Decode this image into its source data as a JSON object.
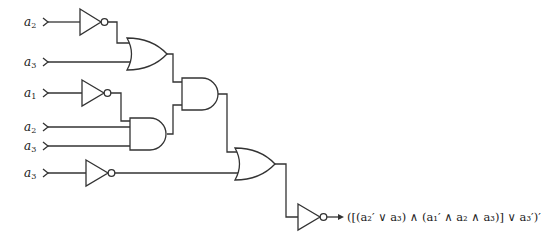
{
  "diagram": {
    "type": "logic-circuit",
    "inputs": [
      {
        "id": "in1",
        "var": "a",
        "sub": "2",
        "y": 22
      },
      {
        "id": "in2",
        "var": "a",
        "sub": "3",
        "y": 62
      },
      {
        "id": "in3",
        "var": "a",
        "sub": "1",
        "y": 93
      },
      {
        "id": "in4",
        "var": "a",
        "sub": "2",
        "y": 127
      },
      {
        "id": "in5",
        "var": "a",
        "sub": "3",
        "y": 146
      },
      {
        "id": "in6",
        "var": "a",
        "sub": "3",
        "y": 173
      }
    ],
    "gates": [
      {
        "id": "not1",
        "type": "NOT",
        "input": "a2"
      },
      {
        "id": "or1",
        "type": "OR",
        "inputs": [
          "not1",
          "a3"
        ]
      },
      {
        "id": "not2",
        "type": "NOT",
        "input": "a1"
      },
      {
        "id": "and2",
        "type": "AND",
        "inputs": [
          "not2",
          "a2",
          "a3"
        ]
      },
      {
        "id": "and1",
        "type": "AND",
        "inputs": [
          "or1",
          "and2"
        ]
      },
      {
        "id": "not3",
        "type": "NOT",
        "input": "a3"
      },
      {
        "id": "or2",
        "type": "OR",
        "inputs": [
          "and1",
          "not3"
        ]
      },
      {
        "id": "not4",
        "type": "NOT",
        "input": "or2"
      }
    ],
    "output_expression": "([(a₂′ ∨ a₃) ∧ (a₁′ ∧ a₂ ∧ a₃)] ∨ a₃′)′"
  }
}
